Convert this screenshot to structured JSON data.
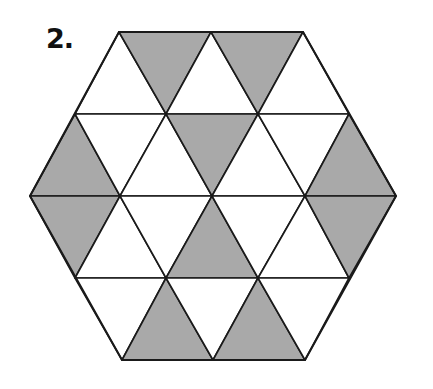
{
  "problem_label": "2.",
  "colors": {
    "shaded": "#a9a9a9",
    "unshaded": "#ffffff",
    "stroke": "#1a1a1a"
  },
  "figure": {
    "shape": "regular hexagon divided into 24 equilateral triangles",
    "triangles": [
      {
        "points": "75,114 119,32 166,114",
        "shaded": false
      },
      {
        "points": "119,32 211,32 166,114",
        "shaded": true
      },
      {
        "points": "166,114 211,32 258,114",
        "shaded": false
      },
      {
        "points": "211,32 303,32 258,114",
        "shaded": true
      },
      {
        "points": "258,114 303,32 349,114",
        "shaded": false
      },
      {
        "points": "30,196 75,114 120,196",
        "shaded": true
      },
      {
        "points": "75,114 166,114 120,196",
        "shaded": false
      },
      {
        "points": "120,196 166,114 212,196",
        "shaded": false
      },
      {
        "points": "166,114 258,114 212,196",
        "shaded": true
      },
      {
        "points": "212,196 258,114 305,196",
        "shaded": false
      },
      {
        "points": "258,114 349,114 305,196",
        "shaded": false
      },
      {
        "points": "305,196 349,114 396,196",
        "shaded": true
      },
      {
        "points": "30,196 120,196 75,278",
        "shaded": true
      },
      {
        "points": "75,278 120,196 166,278",
        "shaded": false
      },
      {
        "points": "120,196 212,196 166,278",
        "shaded": false
      },
      {
        "points": "166,278 212,196 258,278",
        "shaded": true
      },
      {
        "points": "212,196 305,196 258,278",
        "shaded": false
      },
      {
        "points": "258,278 305,196 349,278",
        "shaded": false
      },
      {
        "points": "305,196 396,196 349,278",
        "shaded": true
      },
      {
        "points": "75,278 166,278 122,360",
        "shaded": false
      },
      {
        "points": "122,360 166,278 213,360",
        "shaded": true
      },
      {
        "points": "166,278 258,278 213,360",
        "shaded": false
      },
      {
        "points": "213,360 258,278 305,360",
        "shaded": true
      },
      {
        "points": "258,278 349,278 305,360",
        "shaded": false
      }
    ]
  }
}
